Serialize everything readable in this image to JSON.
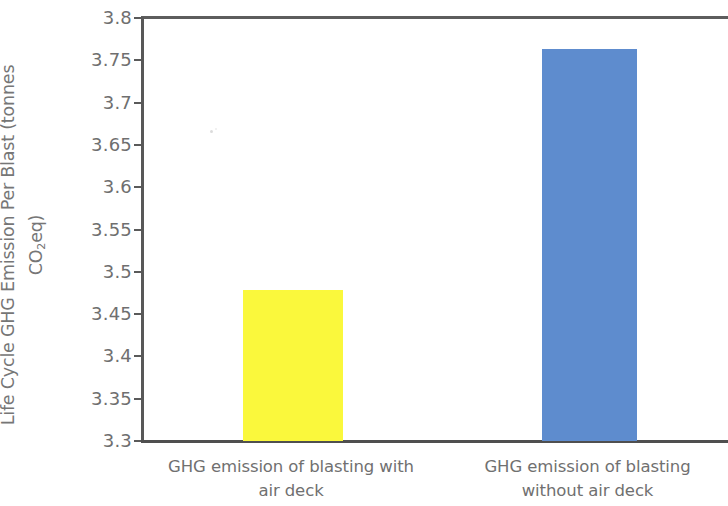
{
  "chart_data": {
    "type": "bar",
    "title": "",
    "xlabel": "",
    "ylabel": "Life Cycle GHG Emission Per Blast (tonnes CO2eq)",
    "ylabel_line1": "Life Cycle GHG Emission Per Blast (tonnes",
    "ylabel_line2_pre": "CO",
    "ylabel_line2_sub": "2",
    "ylabel_line2_post": "eq)",
    "categories": [
      "GHG emission of blasting with air deck",
      "GHG emission of blasting without air deck"
    ],
    "category_lines": [
      [
        "GHG emission of blasting with",
        "air deck"
      ],
      [
        "GHG emission of blasting",
        "without air deck"
      ]
    ],
    "values": [
      3.478,
      3.763
    ],
    "bar_colors": [
      "#faf83c",
      "#5e8cce"
    ],
    "ylim": [
      3.3,
      3.8
    ],
    "ytick_values": [
      3.8,
      3.75,
      3.7,
      3.65,
      3.6,
      3.55,
      3.5,
      3.45,
      3.4,
      3.35,
      3.3
    ],
    "ytick_labels": [
      "3.8",
      "3.75",
      "3.7",
      "3.65",
      "3.6",
      "3.55",
      "3.5",
      "3.45",
      "3.4",
      "3.35",
      "3.3"
    ],
    "grid": false,
    "legend": false,
    "legend_position": "none",
    "axis_color": "#555555",
    "text_color": "#707070",
    "background": "#ffffff"
  }
}
